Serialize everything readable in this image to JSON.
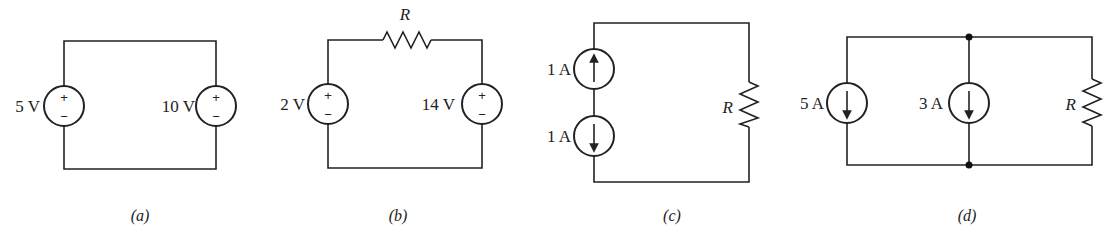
{
  "figure": {
    "panels": [
      {
        "id": "a",
        "caption": "(a)",
        "components": [
          {
            "type": "voltage-source",
            "label": "5 V",
            "plus": "+",
            "minus": "−"
          },
          {
            "type": "voltage-source",
            "label": "10 V",
            "plus": "+",
            "minus": "−"
          }
        ]
      },
      {
        "id": "b",
        "caption": "(b)",
        "components": [
          {
            "type": "voltage-source",
            "label": "2 V",
            "plus": "+",
            "minus": "−"
          },
          {
            "type": "resistor",
            "label": "R"
          },
          {
            "type": "voltage-source",
            "label": "14 V",
            "plus": "+",
            "minus": "−"
          }
        ]
      },
      {
        "id": "c",
        "caption": "(c)",
        "components": [
          {
            "type": "current-source",
            "label": "1 A",
            "direction": "up"
          },
          {
            "type": "current-source",
            "label": "1 A",
            "direction": "down"
          },
          {
            "type": "resistor",
            "label": "R"
          }
        ]
      },
      {
        "id": "d",
        "caption": "(d)",
        "components": [
          {
            "type": "current-source",
            "label": "5 A",
            "direction": "down"
          },
          {
            "type": "current-source",
            "label": "3 A",
            "direction": "down"
          },
          {
            "type": "resistor",
            "label": "R"
          }
        ]
      }
    ]
  }
}
